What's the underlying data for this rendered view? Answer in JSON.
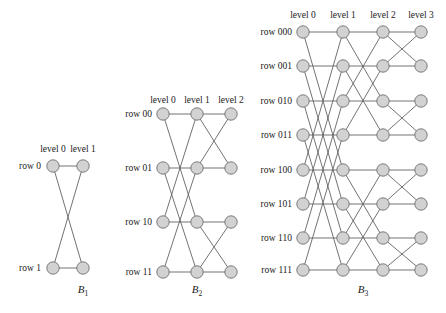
{
  "figure": {
    "background_color": "#ffffff",
    "node_fill": "#d2d2d2",
    "node_stroke": "#6e6e6e",
    "edge_color": "#5a5a5a",
    "node_radius": 6.2
  },
  "diagrams": [
    {
      "id": "B1",
      "caption_base": "B",
      "caption_sub": "1",
      "caption_x": 83,
      "caption_y": 293,
      "levels": [
        "level 0",
        "level 1"
      ],
      "level_x": [
        53,
        83
      ],
      "level_label_y": 152,
      "rows": [
        "row 0",
        "row 1"
      ],
      "row_y": [
        166,
        268
      ],
      "row_label_x": 41,
      "node_radius": 6.2,
      "edges": [
        {
          "from_level": 0,
          "from_row": 0,
          "to_level": 1,
          "to_row": 0
        },
        {
          "from_level": 0,
          "from_row": 0,
          "to_level": 1,
          "to_row": 1
        },
        {
          "from_level": 0,
          "from_row": 1,
          "to_level": 1,
          "to_row": 0
        },
        {
          "from_level": 0,
          "from_row": 1,
          "to_level": 1,
          "to_row": 1
        }
      ]
    },
    {
      "id": "B2",
      "caption_base": "B",
      "caption_sub": "2",
      "caption_x": 197,
      "caption_y": 293,
      "levels": [
        "level 0",
        "level 1",
        "level 2"
      ],
      "level_x": [
        163,
        197,
        231
      ],
      "level_label_y": 103,
      "rows": [
        "row 00",
        "row 01",
        "row 10",
        "row 11"
      ],
      "row_y": [
        114,
        168,
        222,
        272
      ],
      "row_label_x": 152,
      "node_radius": 6.2,
      "edges": [
        {
          "from_level": 0,
          "from_row": 0,
          "to_level": 1,
          "to_row": 0
        },
        {
          "from_level": 0,
          "from_row": 0,
          "to_level": 1,
          "to_row": 2
        },
        {
          "from_level": 0,
          "from_row": 1,
          "to_level": 1,
          "to_row": 1
        },
        {
          "from_level": 0,
          "from_row": 1,
          "to_level": 1,
          "to_row": 3
        },
        {
          "from_level": 0,
          "from_row": 2,
          "to_level": 1,
          "to_row": 2
        },
        {
          "from_level": 0,
          "from_row": 2,
          "to_level": 1,
          "to_row": 0
        },
        {
          "from_level": 0,
          "from_row": 3,
          "to_level": 1,
          "to_row": 3
        },
        {
          "from_level": 0,
          "from_row": 3,
          "to_level": 1,
          "to_row": 1
        },
        {
          "from_level": 1,
          "from_row": 0,
          "to_level": 2,
          "to_row": 0
        },
        {
          "from_level": 1,
          "from_row": 0,
          "to_level": 2,
          "to_row": 1
        },
        {
          "from_level": 1,
          "from_row": 1,
          "to_level": 2,
          "to_row": 1
        },
        {
          "from_level": 1,
          "from_row": 1,
          "to_level": 2,
          "to_row": 0
        },
        {
          "from_level": 1,
          "from_row": 2,
          "to_level": 2,
          "to_row": 2
        },
        {
          "from_level": 1,
          "from_row": 2,
          "to_level": 2,
          "to_row": 3
        },
        {
          "from_level": 1,
          "from_row": 3,
          "to_level": 2,
          "to_row": 3
        },
        {
          "from_level": 1,
          "from_row": 3,
          "to_level": 2,
          "to_row": 2
        }
      ]
    },
    {
      "id": "B3",
      "caption_base": "B",
      "caption_sub": "3",
      "caption_x": 363,
      "caption_y": 293,
      "levels": [
        "level 0",
        "level 1",
        "level 2",
        "level 3"
      ],
      "level_x": [
        303,
        343,
        383,
        421
      ],
      "level_label_y": 18,
      "rows": [
        "row 000",
        "row 001",
        "row 010",
        "row 011",
        "row 100",
        "row 101",
        "row 110",
        "row 111"
      ],
      "row_y": [
        32,
        66,
        101,
        135,
        170,
        204,
        238,
        270
      ],
      "row_label_x": 292,
      "node_radius": 6.2,
      "edges": [
        {
          "from_level": 0,
          "from_row": 0,
          "to_level": 1,
          "to_row": 0
        },
        {
          "from_level": 0,
          "from_row": 0,
          "to_level": 1,
          "to_row": 4
        },
        {
          "from_level": 0,
          "from_row": 1,
          "to_level": 1,
          "to_row": 1
        },
        {
          "from_level": 0,
          "from_row": 1,
          "to_level": 1,
          "to_row": 5
        },
        {
          "from_level": 0,
          "from_row": 2,
          "to_level": 1,
          "to_row": 2
        },
        {
          "from_level": 0,
          "from_row": 2,
          "to_level": 1,
          "to_row": 6
        },
        {
          "from_level": 0,
          "from_row": 3,
          "to_level": 1,
          "to_row": 3
        },
        {
          "from_level": 0,
          "from_row": 3,
          "to_level": 1,
          "to_row": 7
        },
        {
          "from_level": 0,
          "from_row": 4,
          "to_level": 1,
          "to_row": 4
        },
        {
          "from_level": 0,
          "from_row": 4,
          "to_level": 1,
          "to_row": 0
        },
        {
          "from_level": 0,
          "from_row": 5,
          "to_level": 1,
          "to_row": 5
        },
        {
          "from_level": 0,
          "from_row": 5,
          "to_level": 1,
          "to_row": 1
        },
        {
          "from_level": 0,
          "from_row": 6,
          "to_level": 1,
          "to_row": 6
        },
        {
          "from_level": 0,
          "from_row": 6,
          "to_level": 1,
          "to_row": 2
        },
        {
          "from_level": 0,
          "from_row": 7,
          "to_level": 1,
          "to_row": 7
        },
        {
          "from_level": 0,
          "from_row": 7,
          "to_level": 1,
          "to_row": 3
        },
        {
          "from_level": 1,
          "from_row": 0,
          "to_level": 2,
          "to_row": 0
        },
        {
          "from_level": 1,
          "from_row": 0,
          "to_level": 2,
          "to_row": 2
        },
        {
          "from_level": 1,
          "from_row": 1,
          "to_level": 2,
          "to_row": 1
        },
        {
          "from_level": 1,
          "from_row": 1,
          "to_level": 2,
          "to_row": 3
        },
        {
          "from_level": 1,
          "from_row": 2,
          "to_level": 2,
          "to_row": 2
        },
        {
          "from_level": 1,
          "from_row": 2,
          "to_level": 2,
          "to_row": 0
        },
        {
          "from_level": 1,
          "from_row": 3,
          "to_level": 2,
          "to_row": 3
        },
        {
          "from_level": 1,
          "from_row": 3,
          "to_level": 2,
          "to_row": 1
        },
        {
          "from_level": 1,
          "from_row": 4,
          "to_level": 2,
          "to_row": 4
        },
        {
          "from_level": 1,
          "from_row": 4,
          "to_level": 2,
          "to_row": 6
        },
        {
          "from_level": 1,
          "from_row": 5,
          "to_level": 2,
          "to_row": 5
        },
        {
          "from_level": 1,
          "from_row": 5,
          "to_level": 2,
          "to_row": 7
        },
        {
          "from_level": 1,
          "from_row": 6,
          "to_level": 2,
          "to_row": 6
        },
        {
          "from_level": 1,
          "from_row": 6,
          "to_level": 2,
          "to_row": 4
        },
        {
          "from_level": 1,
          "from_row": 7,
          "to_level": 2,
          "to_row": 7
        },
        {
          "from_level": 1,
          "from_row": 7,
          "to_level": 2,
          "to_row": 5
        },
        {
          "from_level": 2,
          "from_row": 0,
          "to_level": 3,
          "to_row": 0
        },
        {
          "from_level": 2,
          "from_row": 0,
          "to_level": 3,
          "to_row": 1
        },
        {
          "from_level": 2,
          "from_row": 1,
          "to_level": 3,
          "to_row": 1
        },
        {
          "from_level": 2,
          "from_row": 1,
          "to_level": 3,
          "to_row": 0
        },
        {
          "from_level": 2,
          "from_row": 2,
          "to_level": 3,
          "to_row": 2
        },
        {
          "from_level": 2,
          "from_row": 2,
          "to_level": 3,
          "to_row": 3
        },
        {
          "from_level": 2,
          "from_row": 3,
          "to_level": 3,
          "to_row": 3
        },
        {
          "from_level": 2,
          "from_row": 3,
          "to_level": 3,
          "to_row": 2
        },
        {
          "from_level": 2,
          "from_row": 4,
          "to_level": 3,
          "to_row": 4
        },
        {
          "from_level": 2,
          "from_row": 4,
          "to_level": 3,
          "to_row": 5
        },
        {
          "from_level": 2,
          "from_row": 5,
          "to_level": 3,
          "to_row": 5
        },
        {
          "from_level": 2,
          "from_row": 5,
          "to_level": 3,
          "to_row": 4
        },
        {
          "from_level": 2,
          "from_row": 6,
          "to_level": 3,
          "to_row": 6
        },
        {
          "from_level": 2,
          "from_row": 6,
          "to_level": 3,
          "to_row": 7
        },
        {
          "from_level": 2,
          "from_row": 7,
          "to_level": 3,
          "to_row": 7
        },
        {
          "from_level": 2,
          "from_row": 7,
          "to_level": 3,
          "to_row": 6
        }
      ]
    }
  ]
}
